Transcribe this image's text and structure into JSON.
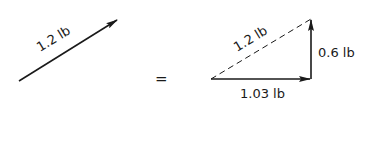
{
  "diagram": {
    "type": "vector-decomposition",
    "left_vector": {
      "label": "1.2 lb",
      "magnitude": 1.2,
      "unit": "lb"
    },
    "equals_sign": "=",
    "triangle": {
      "hypotenuse": {
        "label": "1.2 lb",
        "style": "dashed"
      },
      "horizontal_component": {
        "label": "1.03 lb",
        "value": 1.03
      },
      "vertical_component": {
        "label": "0.6 lb",
        "value": 0.6
      }
    },
    "colors": {
      "ink": "#1a1a1a",
      "background": "#ffffff"
    }
  }
}
